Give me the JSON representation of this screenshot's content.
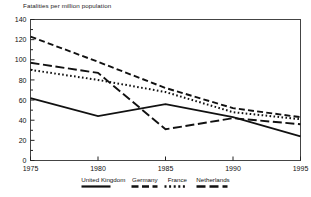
{
  "chart_data": {
    "type": "line",
    "title": "Fatalities per million population",
    "xlabel": "",
    "ylabel": "Fatalities per million population",
    "x": [
      1975,
      1980,
      1985,
      1990,
      1995
    ],
    "xlim": [
      1975,
      1995
    ],
    "ylim": [
      0,
      140
    ],
    "xticks": [
      "1975",
      "1980",
      "1985",
      "1990",
      "1995"
    ],
    "yticks": [
      "0",
      "20",
      "40",
      "60",
      "80",
      "100",
      "120",
      "140"
    ],
    "ytick_values": [
      0,
      20,
      40,
      60,
      80,
      100,
      120,
      140
    ],
    "minor_y_interval": 10,
    "grid": false,
    "legend_position": "bottom",
    "line_color": "#111111",
    "series": [
      {
        "name": "United Kingdom",
        "style": "solid",
        "values": [
          62,
          44,
          56,
          43,
          24
        ]
      },
      {
        "name": "Germany",
        "style": "dashed",
        "values": [
          123,
          98,
          72,
          52,
          43
        ]
      },
      {
        "name": "France",
        "style": "dotted",
        "values": [
          90,
          80,
          68,
          48,
          41
        ]
      },
      {
        "name": "Netherlands",
        "style": "long-dash",
        "values": [
          97,
          87,
          31,
          42,
          36
        ]
      }
    ]
  },
  "legend": {
    "entries": [
      {
        "label": "United Kingdom",
        "swatch": "solid-line-icon"
      },
      {
        "label": "Germany",
        "swatch": "dashed-line-icon"
      },
      {
        "label": "France",
        "swatch": "dotted-line-icon"
      },
      {
        "label": "Netherlands",
        "swatch": "long-dash-line-icon"
      }
    ]
  }
}
